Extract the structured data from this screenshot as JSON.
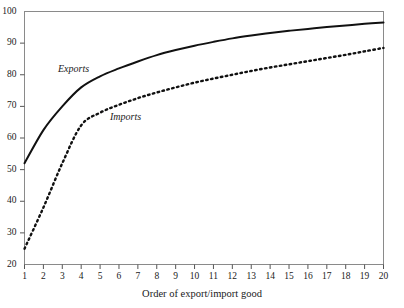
{
  "chart_data": {
    "type": "line",
    "title": "",
    "subtitle": "",
    "xlabel": "Order of export/import good",
    "ylabel": "",
    "xlim": [
      1,
      20
    ],
    "ylim": [
      20,
      100
    ],
    "grid": false,
    "legend_position": "inline-annotation",
    "x": [
      1,
      2,
      3,
      4,
      5,
      6,
      7,
      8,
      9,
      10,
      11,
      12,
      13,
      14,
      15,
      16,
      17,
      18,
      19,
      20
    ],
    "xticks": [
      "1",
      "2",
      "3",
      "4",
      "5",
      "6",
      "7",
      "8",
      "9",
      "10",
      "11",
      "12",
      "13",
      "14",
      "15",
      "16",
      "17",
      "18",
      "19",
      "20"
    ],
    "yticks": [
      "20",
      "30",
      "40",
      "50",
      "60",
      "70",
      "80",
      "90",
      "100"
    ],
    "ytick_values": [
      20,
      30,
      40,
      50,
      60,
      70,
      80,
      90,
      100
    ],
    "series": [
      {
        "name": "Exports",
        "style": "solid",
        "color": "#111111",
        "annotation": "Exports",
        "values": [
          52,
          62.5,
          70,
          76,
          79.5,
          82,
          84.2,
          86.2,
          87.8,
          89.2,
          90.4,
          91.5,
          92.4,
          93.2,
          93.9,
          94.5,
          95.1,
          95.6,
          96.1,
          96.5
        ]
      },
      {
        "name": "Imports",
        "style": "dotted",
        "color": "#111111",
        "annotation": "Imports",
        "values": [
          25,
          38,
          52,
          64,
          68,
          70.5,
          72.6,
          74.4,
          76,
          77.5,
          78.8,
          80,
          81.2,
          82.3,
          83.3,
          84.3,
          85.3,
          86.3,
          87.4,
          88.5
        ]
      }
    ],
    "axis_color": "#6a6a6a",
    "background": "#ffffff"
  }
}
